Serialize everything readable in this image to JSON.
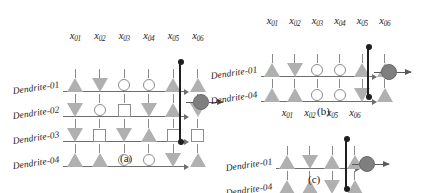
{
  "figure": {
    "symbol_legend": {
      "filled-up-triangle": "excitatory synapse",
      "filled-down-triangle": "inhibitory synapse",
      "open-circle": "non-contributing synapse (circle)",
      "open-square": "non-contributing synapse (square)"
    },
    "colors": {
      "synapse_fill": "#b0b0b0",
      "synapse_outline": "#8c8c8c",
      "dendrite_line": "#6e6e6e",
      "bus": "#1f1f1f",
      "soma_fill": "#7f7f7f",
      "background": "#ffffff"
    }
  },
  "panels": [
    {
      "id": "a",
      "caption": "(a)",
      "inputs": [
        "x01",
        "x02",
        "x03",
        "x04",
        "x05",
        "x06"
      ],
      "input_labels": [
        {
          "base": "x",
          "sub": "01"
        },
        {
          "base": "x",
          "sub": "02"
        },
        {
          "base": "x",
          "sub": "03"
        },
        {
          "base": "x",
          "sub": "04"
        },
        {
          "base": "x",
          "sub": "05"
        },
        {
          "base": "x",
          "sub": "06"
        }
      ],
      "dendrites": [
        {
          "label": "Dendrite-01",
          "synapses": [
            "up",
            "down",
            "circle",
            "circle",
            "up",
            "up"
          ]
        },
        {
          "label": "Dendrite-02",
          "synapses": [
            "down",
            "circle",
            "square",
            "down",
            "up",
            "down"
          ]
        },
        {
          "label": "Dendrite-03",
          "synapses": [
            "down",
            "square",
            "down",
            "up",
            "square",
            "square"
          ]
        },
        {
          "label": "Dendrite-04",
          "synapses": [
            "up",
            "up",
            "circle",
            "circle",
            "down",
            "up"
          ]
        }
      ],
      "soma": {
        "name": "soma",
        "output": "axon-output-arrow"
      }
    },
    {
      "id": "b",
      "caption": "(b)",
      "inputs": [
        "x01",
        "x02",
        "x03",
        "x04",
        "x05",
        "x06"
      ],
      "input_labels": [
        {
          "base": "x",
          "sub": "01"
        },
        {
          "base": "x",
          "sub": "02"
        },
        {
          "base": "x",
          "sub": "03"
        },
        {
          "base": "x",
          "sub": "04"
        },
        {
          "base": "x",
          "sub": "05"
        },
        {
          "base": "x",
          "sub": "06"
        }
      ],
      "dendrites": [
        {
          "label": "Dendrite-01",
          "synapses": [
            "up",
            "down",
            "circle",
            "circle",
            "up",
            "up"
          ]
        },
        {
          "label": "Dendrite-04",
          "synapses": [
            "up",
            "up",
            "circle",
            "circle",
            "down",
            "up"
          ]
        }
      ],
      "soma": {
        "name": "soma",
        "output": "axon-output-arrow"
      }
    },
    {
      "id": "c",
      "caption": "(c)",
      "inputs": [
        "x01",
        "x02",
        "x05",
        "x06"
      ],
      "input_labels": [
        {
          "base": "x",
          "sub": "01"
        },
        {
          "base": "x",
          "sub": "02"
        },
        {
          "base": "x",
          "sub": "05"
        },
        {
          "base": "x",
          "sub": "06"
        }
      ],
      "dendrites": [
        {
          "label": "Dendrite-01",
          "synapses": [
            "up",
            "down",
            "up",
            "up"
          ]
        },
        {
          "label": "Dendrite-04",
          "synapses": [
            "up",
            "up",
            "down",
            "up"
          ]
        }
      ],
      "soma": {
        "name": "soma",
        "output": "axon-output-arrow"
      }
    }
  ]
}
